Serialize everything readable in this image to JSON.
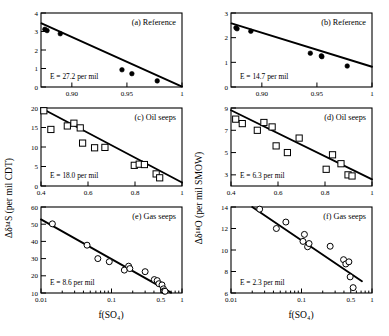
{
  "figure": {
    "axis_titles": {
      "left_y": "Δδ³⁴S (per mil CDT)",
      "right_y": "Δδ¹⁸O (per mil SMOW)",
      "x_bottom_left": "f(SO₄)",
      "x_bottom_right": "f(SO₄)"
    }
  },
  "chart_data": [
    {
      "id": "panel-a",
      "type": "scatter",
      "title": "(a) Reference",
      "annotation": "E = 27.2 per mil",
      "xlabel": "",
      "ylabel": "Δδ³⁴S (per mil CDT)",
      "xscale": "linear",
      "yscale": "linear",
      "xlim": [
        0.872,
        1.0
      ],
      "ylim": [
        0,
        4
      ],
      "xticks": [
        0.9,
        0.95,
        1.0
      ],
      "xticklabels": [
        "0.90",
        "0.95",
        "1"
      ],
      "yticks": [
        0,
        1,
        2,
        3,
        4
      ],
      "yticklabels": [
        "0",
        "1",
        "2",
        "3",
        "4"
      ],
      "marker": "filled-circle",
      "grid": false,
      "points": [
        {
          "x": 0.8755,
          "y": 3.12
        },
        {
          "x": 0.8775,
          "y": 3.05
        },
        {
          "x": 0.8895,
          "y": 2.88
        },
        {
          "x": 0.9455,
          "y": 0.93
        },
        {
          "x": 0.9545,
          "y": 0.72
        },
        {
          "x": 0.9775,
          "y": 0.33
        }
      ],
      "fit_line": {
        "x": [
          0.8725,
          1.0
        ],
        "y": [
          3.44,
          0.02
        ]
      }
    },
    {
      "id": "panel-b",
      "type": "scatter",
      "title": "(b) Reference",
      "annotation": "E = 14.7 per mil",
      "xlabel": "",
      "ylabel": "Δδ¹⁸O (per mil SMOW)",
      "xscale": "linear",
      "yscale": "linear",
      "xlim": [
        0.872,
        1.0
      ],
      "ylim": [
        0,
        3
      ],
      "xticks": [
        0.9,
        0.95,
        1.0
      ],
      "xticklabels": [
        "0.90",
        "0.95",
        "1"
      ],
      "yticks": [
        0,
        1,
        2,
        3
      ],
      "yticklabels": [
        "0",
        "1",
        "2",
        "3"
      ],
      "marker": "filled-circle",
      "grid": false,
      "points": [
        {
          "x": 0.8765,
          "y": 2.4
        },
        {
          "x": 0.8775,
          "y": 2.36
        },
        {
          "x": 0.89,
          "y": 2.26
        },
        {
          "x": 0.944,
          "y": 1.37
        },
        {
          "x": 0.954,
          "y": 1.26
        },
        {
          "x": 0.9545,
          "y": 1.23
        },
        {
          "x": 0.9775,
          "y": 0.85
        }
      ],
      "fit_line": {
        "x": [
          0.8725,
          1.0
        ],
        "y": [
          2.58,
          0.82
        ]
      }
    },
    {
      "id": "panel-c",
      "type": "scatter",
      "title": "(c) Oil seeps",
      "annotation": "E = 18.0 per mil",
      "xlabel": "",
      "ylabel": "Δδ³⁴S (per mil CDT)",
      "xscale": "linear",
      "yscale": "linear",
      "xlim": [
        0.4,
        1.0
      ],
      "ylim": [
        0,
        20
      ],
      "xticks": [
        0.4,
        0.6,
        0.8,
        1.0
      ],
      "xticklabels": [
        "0.4",
        "0.6",
        "0.8",
        "1"
      ],
      "yticks": [
        0,
        5,
        10,
        15,
        20
      ],
      "yticklabels": [
        "0",
        "5",
        "10",
        "15",
        "20"
      ],
      "marker": "open-square",
      "grid": false,
      "points": [
        {
          "x": 0.412,
          "y": 19.3
        },
        {
          "x": 0.442,
          "y": 14.5
        },
        {
          "x": 0.512,
          "y": 15.4
        },
        {
          "x": 0.54,
          "y": 16.1
        },
        {
          "x": 0.567,
          "y": 14.9
        },
        {
          "x": 0.577,
          "y": 11.0
        },
        {
          "x": 0.628,
          "y": 9.8
        },
        {
          "x": 0.672,
          "y": 9.9
        },
        {
          "x": 0.797,
          "y": 5.3
        },
        {
          "x": 0.818,
          "y": 5.6
        },
        {
          "x": 0.84,
          "y": 5.5
        },
        {
          "x": 0.89,
          "y": 3.1
        },
        {
          "x": 0.905,
          "y": 2.1
        }
      ],
      "fit_line": {
        "x": [
          0.4,
          1.0
        ],
        "y": [
          20.0,
          0.9
        ]
      }
    },
    {
      "id": "panel-d",
      "type": "scatter",
      "title": "(d) Oil seeps",
      "annotation": "E = 6.3 per mil",
      "xlabel": "",
      "ylabel": "Δδ¹⁸O (per mil SMOW)",
      "xscale": "linear",
      "yscale": "linear",
      "xlim": [
        0.4,
        1.0
      ],
      "ylim": [
        2,
        9
      ],
      "xticks": [
        0.4,
        0.6,
        0.8,
        1.0
      ],
      "xticklabels": [
        "0.4",
        "0.6",
        "0.8",
        "1"
      ],
      "yticks": [
        3,
        5,
        7,
        9
      ],
      "yticklabels": [
        "3",
        "5",
        "7",
        "9"
      ],
      "marker": "open-square",
      "grid": false,
      "points": [
        {
          "x": 0.42,
          "y": 8.0
        },
        {
          "x": 0.448,
          "y": 7.6
        },
        {
          "x": 0.512,
          "y": 7.0
        },
        {
          "x": 0.54,
          "y": 7.7
        },
        {
          "x": 0.575,
          "y": 7.3
        },
        {
          "x": 0.592,
          "y": 5.6
        },
        {
          "x": 0.64,
          "y": 5.0
        },
        {
          "x": 0.69,
          "y": 6.3
        },
        {
          "x": 0.805,
          "y": 3.5
        },
        {
          "x": 0.832,
          "y": 4.8
        },
        {
          "x": 0.868,
          "y": 4.0
        },
        {
          "x": 0.898,
          "y": 3.0
        },
        {
          "x": 0.915,
          "y": 2.9
        }
      ],
      "fit_line": {
        "x": [
          0.4,
          1.0
        ],
        "y": [
          8.8,
          2.6
        ]
      }
    },
    {
      "id": "panel-e",
      "type": "scatter",
      "title": "(e) Gas seeps",
      "annotation": "E = 8.6 per mil",
      "xlabel": "f(SO₄)",
      "ylabel": "Δδ³⁴S (per mil CDT)",
      "xscale": "log",
      "yscale": "linear",
      "xlim": [
        0.01,
        1.0
      ],
      "ylim": [
        10,
        60
      ],
      "xticks": [
        0.01,
        0.1,
        0.5,
        1.0
      ],
      "xticklabels": [
        "0.01",
        "0.1",
        "0.5",
        "1"
      ],
      "yticks": [
        10,
        20,
        30,
        40,
        50,
        60
      ],
      "yticklabels": [
        "10",
        "20",
        "30",
        "40",
        "50",
        "60"
      ],
      "marker": "open-circle",
      "grid": false,
      "points": [
        {
          "x": 0.0145,
          "y": 50.2
        },
        {
          "x": 0.045,
          "y": 37.8
        },
        {
          "x": 0.064,
          "y": 30.0
        },
        {
          "x": 0.093,
          "y": 28.2
        },
        {
          "x": 0.152,
          "y": 23.3
        },
        {
          "x": 0.175,
          "y": 25.6
        },
        {
          "x": 0.182,
          "y": 24.2
        },
        {
          "x": 0.3,
          "y": 22.4
        },
        {
          "x": 0.405,
          "y": 17.8
        },
        {
          "x": 0.445,
          "y": 17.2
        },
        {
          "x": 0.47,
          "y": 15.4
        },
        {
          "x": 0.52,
          "y": 14.7
        },
        {
          "x": 0.545,
          "y": 12.4
        },
        {
          "x": 0.555,
          "y": 11.2
        },
        {
          "x": 0.575,
          "y": 11.0
        }
      ],
      "fit_line": {
        "x": [
          0.01,
          0.7
        ],
        "y": [
          52.8,
          10.2
        ]
      }
    },
    {
      "id": "panel-f",
      "type": "scatter",
      "title": "(f) Gas seeps",
      "annotation": "E = 2.3 per mil",
      "xlabel": "f(SO₄)",
      "ylabel": "Δδ¹⁸O (per mil SMOW)",
      "xscale": "log",
      "yscale": "linear",
      "xlim": [
        0.01,
        1.0
      ],
      "ylim": [
        6,
        14
      ],
      "xticks": [
        0.01,
        0.1,
        0.5,
        1.0
      ],
      "xticklabels": [
        "0.01",
        "0.1",
        "0.5",
        "1"
      ],
      "yticks": [
        6,
        8,
        10,
        12,
        14
      ],
      "yticklabels": [
        "6",
        "8",
        "10",
        "12",
        "14"
      ],
      "marker": "open-circle",
      "grid": false,
      "points": [
        {
          "x": 0.0255,
          "y": 13.8
        },
        {
          "x": 0.044,
          "y": 12.0
        },
        {
          "x": 0.06,
          "y": 12.6
        },
        {
          "x": 0.105,
          "y": 10.8
        },
        {
          "x": 0.11,
          "y": 11.45
        },
        {
          "x": 0.122,
          "y": 10.3
        },
        {
          "x": 0.128,
          "y": 10.6
        },
        {
          "x": 0.255,
          "y": 10.35
        },
        {
          "x": 0.395,
          "y": 9.1
        },
        {
          "x": 0.425,
          "y": 8.7
        },
        {
          "x": 0.47,
          "y": 8.9
        },
        {
          "x": 0.49,
          "y": 7.5
        },
        {
          "x": 0.54,
          "y": 6.5
        }
      ],
      "fit_line": {
        "x": [
          0.02,
          0.72
        ],
        "y": [
          14.0,
          7.1
        ]
      }
    }
  ]
}
